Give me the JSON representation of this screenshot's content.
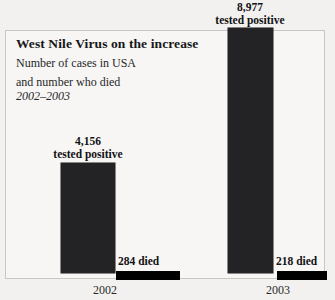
{
  "header": {
    "title": "West Nile Virus on the increase",
    "subtitle_line1": "Number of cases in USA",
    "subtitle_line2": "and number who died",
    "period": "2002–2003"
  },
  "colors": {
    "background": "#f2f1ef",
    "panel": "#f7f6f4",
    "frame_border": "#c9c7c3",
    "bar_positive": "#232326",
    "bar_died": "#000000",
    "text": "#17171a"
  },
  "chart_data": {
    "type": "bar",
    "title": "West Nile Virus on the increase",
    "subtitle": "Number of cases in USA and number who died",
    "annotation": "2002–2003",
    "xlabel": "",
    "ylabel": "",
    "grid": false,
    "legend": "none",
    "categories": [
      "2002",
      "2003"
    ],
    "series": [
      {
        "name": "tested positive",
        "values": [
          4156,
          8977
        ],
        "value_labels": [
          "4,156",
          "8,977"
        ],
        "label_caption": "tested positive"
      },
      {
        "name": "died",
        "values": [
          284,
          218
        ],
        "value_labels": [
          "284 died",
          "218 died"
        ],
        "label_caption": "died"
      }
    ],
    "ylim": [
      0,
      8977
    ]
  },
  "labels": {
    "y2002": {
      "positive_number": "4,156",
      "positive_caption": "tested positive",
      "died": "284 died",
      "year": "2002"
    },
    "y2003": {
      "positive_number": "8,977",
      "positive_caption": "tested positive",
      "died": "218 died",
      "year": "2003"
    }
  }
}
